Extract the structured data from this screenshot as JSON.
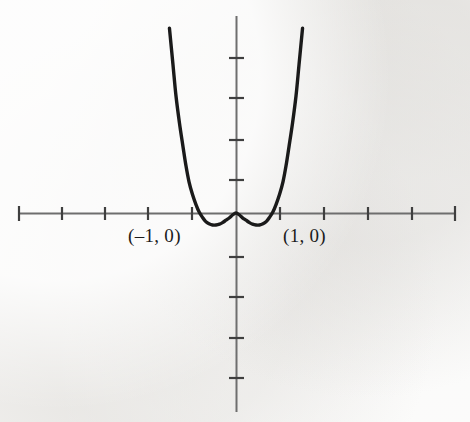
{
  "figure": {
    "background_color": "#f2f1ef",
    "width": 470,
    "height": 422
  },
  "annotations": {
    "root_negative_label": "(–1, 0)",
    "root_positive_label": "(1, 0)"
  },
  "chart_data": {
    "type": "line",
    "title": "",
    "subtitle": "",
    "xlabel": "",
    "ylabel": "",
    "grid": false,
    "legend": null,
    "curve_color": "#1a1a1a",
    "axis_color": "#6b6b6b",
    "origin_px": {
      "x": 236,
      "y": 213
    },
    "unit_px": {
      "x": 43.5,
      "y": 40
    },
    "xlim": [
      -5.0,
      5.06
    ],
    "ylim": [
      -4.98,
      4.93
    ],
    "x_axis_range_px": [
      18,
      456
    ],
    "y_axis_range_px": [
      16,
      412
    ],
    "x_tick_positions_px": [
      18,
      62,
      105,
      148,
      192,
      280,
      324,
      368,
      412,
      456
    ],
    "y_tick_positions_px": [
      58,
      98,
      140,
      180,
      257,
      297,
      338,
      378
    ],
    "x_tick_values": [
      -5,
      -4,
      -3,
      -2,
      -1,
      1,
      2,
      3,
      4,
      5
    ],
    "y_tick_values": [
      3.875,
      2.875,
      1.825,
      0.825,
      -1.1,
      -2.1,
      -3.125,
      -4.125
    ],
    "roots": [
      -1,
      1
    ],
    "local_maxima": [
      {
        "x": 0,
        "y": 0
      }
    ],
    "local_minima": [
      {
        "x": -0.62,
        "y": -0.28
      },
      {
        "x": 0.62,
        "y": -0.28
      }
    ],
    "x": [
      -1.53,
      -1.45,
      -1.38,
      -1.3,
      -1.22,
      -1.15,
      -1.08,
      -1.0,
      -0.92,
      -0.85,
      -0.77,
      -0.7,
      -0.62,
      -0.54,
      -0.46,
      -0.38,
      -0.31,
      -0.23,
      -0.15,
      -0.08,
      0.0,
      0.08,
      0.15,
      0.23,
      0.31,
      0.38,
      0.46,
      0.54,
      0.62,
      0.7,
      0.77,
      0.85,
      0.92,
      1.0,
      1.08,
      1.15,
      1.22,
      1.3,
      1.38,
      1.45,
      1.53
    ],
    "y": [
      4.62,
      3.72,
      2.93,
      2.25,
      1.67,
      1.18,
      0.78,
      0.46,
      0.21,
      0.03,
      -0.11,
      -0.21,
      -0.27,
      -0.3,
      -0.3,
      -0.28,
      -0.24,
      -0.18,
      -0.12,
      -0.05,
      0.0,
      -0.05,
      -0.12,
      -0.18,
      -0.24,
      -0.28,
      -0.3,
      -0.3,
      -0.27,
      -0.21,
      -0.11,
      0.03,
      0.21,
      0.46,
      0.78,
      1.18,
      1.67,
      2.25,
      2.93,
      3.72,
      4.62
    ]
  }
}
